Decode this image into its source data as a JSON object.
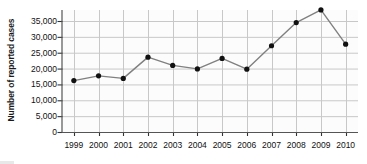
{
  "chart_data": {
    "type": "line",
    "title": "",
    "xlabel": "",
    "ylabel": "Number of reported cases",
    "categories": [
      "1999",
      "2000",
      "2001",
      "2002",
      "2003",
      "2004",
      "2005",
      "2006",
      "2007",
      "2008",
      "2009",
      "2010"
    ],
    "values": [
      16200,
      17700,
      16900,
      23600,
      21000,
      19900,
      23200,
      19800,
      27200,
      34500,
      38500,
      27700
    ],
    "series": [
      {
        "name": "Number of reported cases",
        "values": [
          16200,
          17700,
          16900,
          23600,
          21000,
          19900,
          23200,
          19800,
          27200,
          34500,
          38500,
          27700
        ]
      }
    ],
    "ylim": [
      0,
      40000
    ],
    "xlim": [
      "1999",
      "2010"
    ],
    "ytick_values": [
      0,
      5000,
      10000,
      15000,
      20000,
      25000,
      30000,
      35000
    ],
    "ytick_labels": [
      "0",
      "5,000",
      "10,000",
      "15,000",
      "20,000",
      "25,000",
      "30,000",
      "35,000"
    ],
    "xtick_labels": [
      "1999",
      "2000",
      "2001",
      "2002",
      "2003",
      "2004",
      "2005",
      "2006",
      "2007",
      "2008",
      "2009",
      "2010"
    ],
    "grid": true,
    "grid_axis": "both",
    "legend": "none",
    "marker": "circle",
    "marker_color": "#111111",
    "line_color": "#808080",
    "grid_color": "#c8c8c8",
    "axis_color": "#555555",
    "plot_background": "#fcfcfc"
  },
  "axes": {
    "y_title": "Number of reported cases"
  }
}
